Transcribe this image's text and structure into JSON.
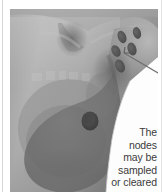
{
  "figure": {
    "name": "breast-and-axillary-lymph-nodes",
    "alt": "Grayscale photographic illustration of a female chest showing the breast with a tinted teardrop-shaped overlay and a cluster of dark oval lymph nodes in the armpit, connected by a leader line to a caption"
  },
  "callout": {
    "lines": [
      "The",
      "nodes",
      "may be",
      "sampled",
      "or cleared"
    ],
    "full_text": "The nodes may be sampled or cleared",
    "align": "right"
  },
  "anatomy": {
    "breast_overlay_label": "breast-tissue-overlay",
    "nipple_label": "nipple",
    "node_cluster_label": "axillary-lymph-node-cluster",
    "node_count": 5,
    "leader_line_label": "callout-leader-line",
    "neck_hollow_label": "suprasternal-notch"
  },
  "colors": {
    "plate_background": "#8f8f8f",
    "skin_light": "#b9b9b9",
    "skin_mid": "#9c9c9c",
    "skin_shadow": "#6f6f6f",
    "breast_overlay": "#6e6e6e",
    "nipple": "#4a4a4a",
    "node_fill": "#555555",
    "callout_white": "#fdfdfd",
    "leader_line": "#7a7a7a",
    "text": "#3b3b3b",
    "rule": "#d8d8d8"
  }
}
